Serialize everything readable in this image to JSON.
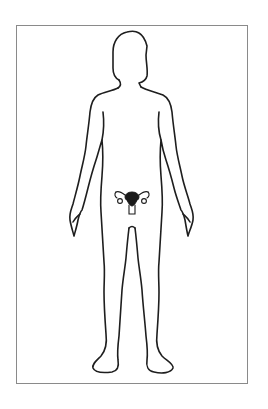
{
  "diagram": {
    "description": "Front-view outline of a female human body with the uterus and ovaries highlighted in the pelvic region",
    "highlighted_organ": "uterus with fallopian tubes and ovaries",
    "colors": {
      "outline": "#1e1e1e",
      "frame_border": "#8a8a8a",
      "organ_fill": "#1a1a1a",
      "background": "#ffffff"
    }
  }
}
